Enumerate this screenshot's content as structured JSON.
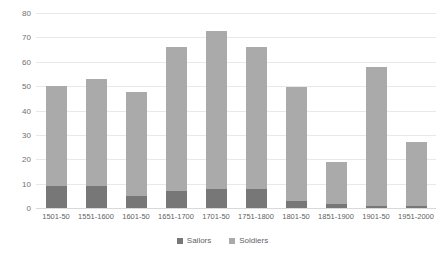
{
  "chart_data": {
    "type": "bar",
    "stacked": true,
    "title": "",
    "xlabel": "",
    "ylabel": "",
    "ylim": [
      0,
      80
    ],
    "yticks": [
      0,
      10,
      20,
      30,
      40,
      50,
      60,
      70,
      80
    ],
    "grid": true,
    "legend_position": "bottom",
    "categories": [
      "1501-50",
      "1551-1600",
      "1601-50",
      "1651-1700",
      "1701-50",
      "1751-1800",
      "1801-50",
      "1851-1900",
      "1901-50",
      "1951-2000"
    ],
    "series": [
      {
        "name": "Sailors",
        "color": "#777777",
        "values": [
          9,
          9,
          5,
          7,
          8,
          8,
          3,
          1.5,
          1,
          1
        ]
      },
      {
        "name": "Soldiers",
        "color": "#aaaaaa",
        "values": [
          41,
          44,
          42.5,
          59,
          64.5,
          58,
          46.5,
          17.5,
          57,
          26
        ]
      }
    ],
    "totals": [
      50,
      53,
      47.5,
      66,
      72.5,
      66,
      49.5,
      19,
      58,
      27
    ]
  },
  "legend": {
    "entries": [
      {
        "label": "Sailors"
      },
      {
        "label": "Soldiers"
      }
    ]
  },
  "colors": {
    "sailors": "#777777",
    "soldiers": "#aaaaaa",
    "gridline": "#e8e8e8",
    "axis_text": "#6f6f6f",
    "background": "#ffffff"
  }
}
